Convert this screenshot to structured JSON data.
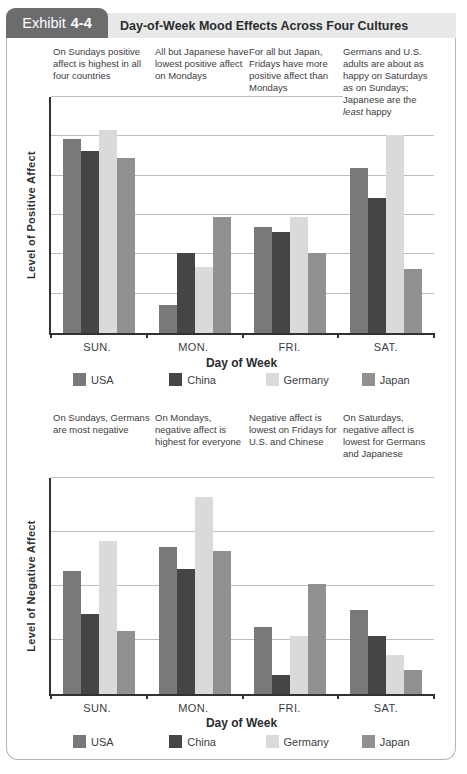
{
  "header": {
    "tab_label": "Exhibit",
    "tab_number": "4-4",
    "title": "Day-of-Week Mood Effects Across Four Cultures"
  },
  "colors": {
    "series": [
      "#77797b",
      "#434547",
      "#d9dbda",
      "#8f9193"
    ],
    "tab_bg": "#6a6c6e",
    "header_bg": "#e8eae9",
    "card_border": "#b3b5b7",
    "grid": "#bcbebd",
    "axis": "#2f3133"
  },
  "legend": {
    "items": [
      {
        "label": "USA"
      },
      {
        "label": "China"
      },
      {
        "label": "Germany"
      },
      {
        "label": "Japan"
      }
    ]
  },
  "chart_data": [
    {
      "type": "bar",
      "title": "",
      "categories": [
        "SUN.",
        "MON.",
        "FRI.",
        "SAT."
      ],
      "series": [
        {
          "name": "USA",
          "values": [
            8.2,
            1.2,
            4.5,
            7.0
          ]
        },
        {
          "name": "China",
          "values": [
            7.7,
            3.4,
            4.3,
            5.7
          ]
        },
        {
          "name": "Germany",
          "values": [
            8.6,
            2.8,
            4.9,
            8.4
          ]
        },
        {
          "name": "Japan",
          "values": [
            7.4,
            4.9,
            3.4,
            2.7
          ]
        }
      ],
      "xlabel": "Day of Week",
      "ylabel": "Level of Positive Affect",
      "ylim": [
        0,
        10
      ],
      "grid": true,
      "gridline_values": [
        1.67,
        3.33,
        5.0,
        6.67,
        8.33,
        10
      ],
      "legend_position": "bottom",
      "annotations": [
        {
          "pre": "On Sundays positive affect is highest in all four countries",
          "italic": "",
          "post": ""
        },
        {
          "pre": "All but Japanese have lowest positive affect on Mondays",
          "italic": "",
          "post": ""
        },
        {
          "pre": "For all but Japan, Fridays have more positive affect than Mondays",
          "italic": "",
          "post": ""
        },
        {
          "pre": "Germans and U.S. adults are about as happy on Saturdays as on Sundays; Japanese are the ",
          "italic": "least",
          "post": " happy"
        }
      ]
    },
    {
      "type": "bar",
      "title": "",
      "categories": [
        "SUN.",
        "MON.",
        "FRI.",
        "SAT."
      ],
      "series": [
        {
          "name": "USA",
          "values": [
            5.7,
            6.8,
            3.1,
            3.9
          ]
        },
        {
          "name": "China",
          "values": [
            3.7,
            5.8,
            0.9,
            2.7
          ]
        },
        {
          "name": "Germany",
          "values": [
            7.1,
            9.1,
            2.7,
            1.8
          ]
        },
        {
          "name": "Japan",
          "values": [
            2.9,
            6.6,
            5.1,
            1.1
          ]
        }
      ],
      "xlabel": "Day of Week",
      "ylabel": "Level of Negative Affect",
      "ylim": [
        0,
        10
      ],
      "grid": true,
      "gridline_values": [
        2.5,
        5.0,
        7.5,
        10
      ],
      "legend_position": "bottom",
      "annotations": [
        {
          "pre": "On Sundays, Germans are most negative",
          "italic": "",
          "post": ""
        },
        {
          "pre": "On Mondays, negative affect is highest for everyone",
          "italic": "",
          "post": ""
        },
        {
          "pre": "Negative affect is lowest on Fridays for U.S. and Chinese",
          "italic": "",
          "post": ""
        },
        {
          "pre": "On Saturdays, negative affect is lowest for Germans and Japanese",
          "italic": "",
          "post": ""
        }
      ]
    }
  ]
}
